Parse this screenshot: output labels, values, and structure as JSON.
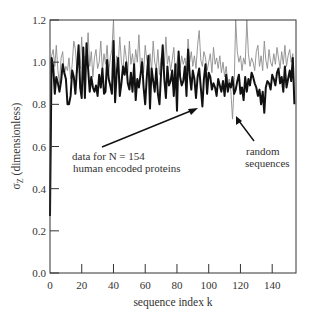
{
  "chart_data": {
    "type": "line",
    "title": "",
    "xlabel": "sequence index k",
    "ylabel": "σ_Z (dimensionless)",
    "ylabel_main": "σ",
    "ylabel_sub": "Z",
    "ylabel_rest": " (dimensionless)",
    "xlim": [
      0,
      155
    ],
    "ylim": [
      0.0,
      1.2
    ],
    "xticks": [
      0,
      20,
      40,
      60,
      80,
      100,
      120,
      140
    ],
    "yticks": [
      "0.0",
      "0.2",
      "0.4",
      "0.6",
      "0.8",
      "1.0",
      "1.2"
    ],
    "grid": false,
    "legend": "none (annotations with arrows)",
    "annotations": [
      {
        "lines": [
          "data for N = 154",
          "human encoded proteins"
        ],
        "arrow_to_series": "human_proteins"
      },
      {
        "lines": [
          "random",
          "sequences"
        ],
        "arrow_to_series": "random_sequences"
      }
    ],
    "series": [
      {
        "name": "human_proteins",
        "label": "data for N = 154 human encoded proteins",
        "style": "thick black",
        "color": "#111111",
        "width": 2.0,
        "x_start": 0,
        "values": [
          0.27,
          1.02,
          0.98,
          0.85,
          0.93,
          0.9,
          0.86,
          0.91,
          0.99,
          0.95,
          0.92,
          0.8,
          0.8,
          0.84,
          0.96,
          0.93,
          0.85,
          0.97,
          1.08,
          0.88,
          0.83,
          1.07,
          0.83,
          1.09,
          0.97,
          0.86,
          0.93,
          0.88,
          0.86,
          0.89,
          0.84,
          0.94,
          0.88,
          0.97,
          0.85,
          0.86,
          1.01,
          0.92,
          0.89,
          0.85,
          1.1,
          0.81,
          0.95,
          1.02,
          0.84,
          0.9,
          0.98,
          0.94,
          1.0,
          0.9,
          0.87,
          0.95,
          0.86,
          0.99,
          0.82,
          0.92,
          0.88,
          0.94,
          1.0,
          0.88,
          0.8,
          0.93,
          1.03,
          0.78,
          0.97,
          0.91,
          0.86,
          0.97,
          0.85,
          0.8,
          0.95,
          1.08,
          0.92,
          0.83,
          0.98,
          0.89,
          0.91,
          0.96,
          0.84,
          0.99,
          0.77,
          1.05,
          0.93,
          0.89,
          0.91,
          0.98,
          0.84,
          1.06,
          0.94,
          0.87,
          0.96,
          0.92,
          0.83,
          0.93,
          0.97,
          0.88,
          0.79,
          0.92,
          0.99,
          0.85,
          0.95,
          0.93,
          0.87,
          0.9,
          0.88,
          0.84,
          0.92,
          0.89,
          0.86,
          0.91,
          0.84,
          0.94,
          0.86,
          0.9,
          0.88,
          0.93,
          0.85,
          0.87,
          0.91,
          0.94,
          0.85,
          0.88,
          0.82,
          0.93,
          0.86,
          0.92,
          0.89,
          0.95,
          0.93,
          0.9,
          0.88,
          0.84,
          0.87,
          0.8,
          0.86,
          0.76,
          0.88,
          0.91,
          0.9,
          0.87,
          0.94,
          0.92,
          0.89,
          0.95,
          0.97,
          0.9,
          0.93,
          0.86,
          0.98,
          0.88,
          0.92,
          0.96,
          0.91,
          1.02,
          0.8
        ]
      },
      {
        "name": "random_sequences",
        "label": "random sequences",
        "style": "thin gray",
        "color": "#8c8c8c",
        "width": 0.9,
        "x_start": 0,
        "values": [
          0.3,
          1.03,
          1.06,
          0.98,
          1.08,
          0.96,
          0.9,
          1.02,
          1.05,
          0.94,
          0.98,
          0.96,
          1.02,
          0.92,
          0.99,
          1.1,
          1.06,
          0.95,
          1.0,
          0.97,
          1.12,
          0.95,
          1.03,
          1.0,
          1.14,
          0.98,
          1.05,
          0.93,
          1.02,
          1.06,
          0.97,
          1.0,
          1.1,
          0.96,
          1.04,
          0.99,
          1.08,
          0.95,
          1.02,
          1.06,
          1.2,
          0.94,
          1.03,
          0.98,
          1.12,
          1.0,
          0.96,
          1.08,
          1.02,
          0.95,
          1.1,
          0.99,
          1.04,
          0.96,
          1.06,
          1.0,
          1.13,
          0.97,
          1.02,
          0.95,
          1.08,
          1.01,
          0.98,
          1.04,
          0.96,
          1.1,
          1.0,
          0.97,
          1.06,
          0.94,
          1.02,
          1.05,
          0.98,
          1.12,
          0.99,
          1.03,
          0.96,
          1.01,
          1.07,
          0.95,
          1.0,
          1.04,
          0.97,
          1.03,
          0.99,
          1.02,
          0.96,
          1.11,
          1.0,
          1.05,
          0.98,
          1.03,
          0.97,
          1.08,
          1.15,
          1.01,
          0.98,
          1.05,
          1.02,
          0.96,
          1.0,
          1.04,
          0.95,
          1.07,
          0.99,
          1.02,
          0.97,
          1.03,
          0.95,
          1.0,
          0.93,
          0.98,
          0.9,
          0.92,
          0.86,
          0.73,
          0.88,
          1.22,
          1.05,
          1.0,
          1.03,
          0.96,
          1.02,
          0.99,
          1.2,
          1.04,
          0.98,
          1.02,
          1.0,
          0.96,
          1.05,
          1.08,
          0.98,
          1.03,
          0.96,
          1.1,
          1.01,
          0.97,
          1.06,
          1.0,
          0.98,
          1.04,
          0.99,
          1.07,
          1.02,
          0.97,
          1.05,
          0.99,
          1.08,
          0.98,
          1.03,
          1.06,
          1.0,
          1.04,
          0.82
        ]
      }
    ]
  }
}
